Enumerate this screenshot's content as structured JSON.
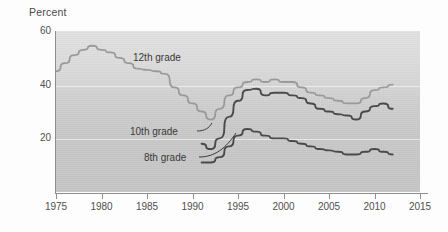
{
  "chart_data": {
    "type": "line",
    "title": "",
    "ylabel": "Percent",
    "xlabel": "",
    "ylim": [
      0,
      60
    ],
    "xlim": [
      1975,
      2015
    ],
    "grid": true,
    "legend_position": "inline-annotations",
    "ytick_labels": [
      "60",
      "40",
      "20"
    ],
    "ytick_values": [
      60,
      40,
      20
    ],
    "xtick_labels": [
      "1975",
      "1980",
      "1985",
      "1990",
      "1995",
      "2000",
      "2005",
      "2010",
      "2015"
    ],
    "xtick_values": [
      1975,
      1980,
      1985,
      1990,
      1995,
      2000,
      2005,
      2010,
      2015
    ],
    "series": [
      {
        "name": "12th grade",
        "color": "#9a9a9a",
        "x": [
          1975,
          1976,
          1977,
          1978,
          1979,
          1980,
          1981,
          1982,
          1983,
          1984,
          1985,
          1986,
          1987,
          1988,
          1989,
          1990,
          1991,
          1992,
          1993,
          1994,
          1995,
          1996,
          1997,
          1998,
          1999,
          2000,
          2001,
          2002,
          2003,
          2004,
          2005,
          2006,
          2007,
          2008,
          2009,
          2010,
          2011,
          2012
        ],
        "values": [
          45,
          48,
          51,
          53,
          54.5,
          53,
          52,
          50,
          48,
          46,
          45.5,
          45,
          44,
          39,
          36,
          33,
          30,
          27,
          31,
          36,
          39,
          41,
          42,
          41,
          42,
          41,
          41,
          39,
          37,
          36,
          35,
          34,
          33,
          33,
          35,
          38,
          39,
          40
        ]
      },
      {
        "name": "10th grade",
        "color": "#4a4a4a",
        "x": [
          1991,
          1992,
          1993,
          1994,
          1995,
          1996,
          1997,
          1998,
          1999,
          2000,
          2001,
          2002,
          2003,
          2004,
          2005,
          2006,
          2007,
          2008,
          2009,
          2010,
          2011,
          2012
        ],
        "values": [
          18,
          16,
          20,
          28,
          34,
          38,
          38.5,
          36,
          37,
          37,
          36,
          35,
          33,
          31,
          30,
          29,
          28.5,
          27,
          30,
          32,
          33,
          31
        ]
      },
      {
        "name": "8th grade",
        "color": "#4a4a4a",
        "x": [
          1991,
          1992,
          1993,
          1994,
          1995,
          1996,
          1997,
          1998,
          1999,
          2000,
          2001,
          2002,
          2003,
          2004,
          2005,
          2006,
          2007,
          2008,
          2009,
          2010,
          2011,
          2012
        ],
        "values": [
          11,
          11,
          13,
          17,
          21,
          23.5,
          22.5,
          21,
          20,
          20,
          19,
          18,
          17,
          16,
          15.5,
          15,
          14,
          14,
          15,
          16,
          15,
          14
        ]
      }
    ],
    "annotations": [
      {
        "text": "12th grade",
        "series": "12th grade"
      },
      {
        "text": "10th grade",
        "series": "10th grade"
      },
      {
        "text": "8th grade",
        "series": "8th grade"
      }
    ]
  }
}
